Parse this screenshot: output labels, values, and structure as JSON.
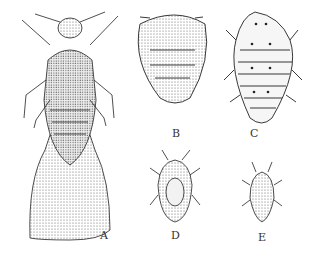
{
  "figure": {
    "panels": [
      {
        "id": "A",
        "label": "A",
        "description": "winged adult, dorsal view"
      },
      {
        "id": "B",
        "label": "B",
        "description": "rounded stippled nymph"
      },
      {
        "id": "C",
        "label": "C",
        "description": "spotted segmented nymph"
      },
      {
        "id": "D",
        "label": "D",
        "description": "small nymph with antennae"
      },
      {
        "id": "E",
        "label": "E",
        "description": "smallest early-instar nymph"
      }
    ]
  }
}
